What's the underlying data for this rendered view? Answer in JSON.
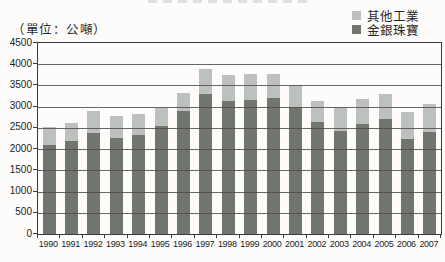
{
  "header": {
    "unit_label": "（單位：公噸）"
  },
  "legend": {
    "items": [
      {
        "label": "其他工業",
        "color": "#bdc1bd"
      },
      {
        "label": "金銀珠寶",
        "color": "#70756f"
      }
    ]
  },
  "chart_data": {
    "type": "bar",
    "stacked": true,
    "title": "",
    "xlabel": "",
    "ylabel": "",
    "unit": "公噸",
    "categories": [
      "1990",
      "1991",
      "1992",
      "1993",
      "1994",
      "1995",
      "1996",
      "1997",
      "1998",
      "1999",
      "2000",
      "2001",
      "2002",
      "2003",
      "2004",
      "2005",
      "2006",
      "2007"
    ],
    "series": [
      {
        "name": "金銀珠寶",
        "color": "#70756f",
        "values": [
          2100,
          2200,
          2390,
          2270,
          2340,
          2540,
          2900,
          3310,
          3130,
          3150,
          3200,
          3000,
          2640,
          2420,
          2600,
          2700,
          2250,
          2400
        ]
      },
      {
        "name": "其他工業",
        "color": "#bdc1bd",
        "values": [
          420,
          420,
          510,
          500,
          490,
          430,
          430,
          570,
          610,
          630,
          560,
          500,
          500,
          580,
          580,
          600,
          630,
          660
        ]
      }
    ],
    "ylim": [
      0,
      4500
    ],
    "ytick_step": 500,
    "grid": true,
    "legend_position": "top-right"
  }
}
